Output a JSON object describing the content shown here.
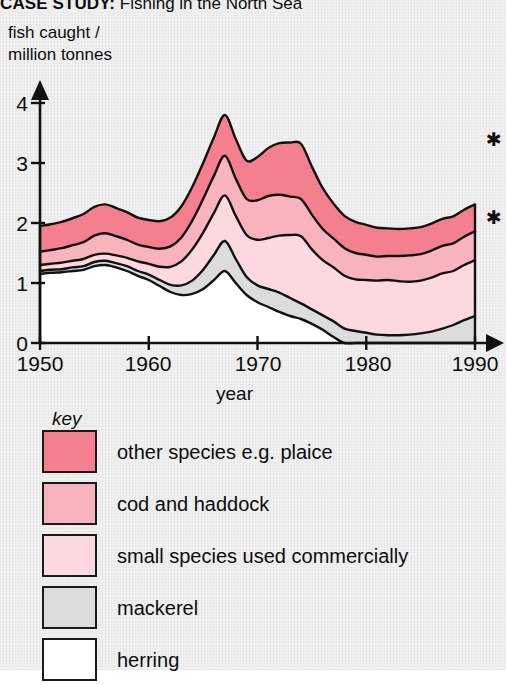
{
  "title": {
    "lead": "CASE STUDY:",
    "rest": " Fishing in the North Sea"
  },
  "y_caption": "fish caught /\nmillion tonnes",
  "annotations": {
    "star_upper": "✱",
    "star_lower": "✱"
  },
  "legend": {
    "heading": "key",
    "items": [
      {
        "label": "other species e.g. plaice",
        "color": "#f4808f"
      },
      {
        "label": "cod and haddock",
        "color": "#f8b3bd"
      },
      {
        "label": "small species used commercially",
        "color": "#fbd9de"
      },
      {
        "label": "mackerel",
        "color": "#dcdcdc"
      },
      {
        "label": "herring",
        "color": "#ffffff"
      }
    ]
  },
  "chart_data": {
    "type": "area",
    "title": "CASE STUDY: Fishing in the North Sea",
    "xlabel": "year",
    "ylabel": "fish caught / million tonnes",
    "xlim": [
      1950,
      1990
    ],
    "ylim": [
      0,
      4
    ],
    "xticks": [
      1950,
      1960,
      1970,
      1980,
      1990
    ],
    "yticks": [
      0,
      1,
      2,
      3,
      4
    ],
    "grid": false,
    "legend_position": "below-plot",
    "stacked": true,
    "stack_order_bottom_to_top": [
      "herring",
      "mackerel",
      "small species used commercially",
      "cod and haddock",
      "other species e.g. plaice"
    ],
    "x": [
      1950,
      1951,
      1952,
      1953,
      1954,
      1955,
      1956,
      1957,
      1958,
      1959,
      1960,
      1961,
      1962,
      1963,
      1964,
      1965,
      1966,
      1967,
      1968,
      1969,
      1970,
      1971,
      1972,
      1973,
      1974,
      1975,
      1976,
      1977,
      1978,
      1979,
      1980,
      1981,
      1982,
      1983,
      1984,
      1985,
      1986,
      1987,
      1988,
      1989,
      1990
    ],
    "series": [
      {
        "name": "herring",
        "color": "#ffffff",
        "values": [
          1.15,
          1.17,
          1.18,
          1.2,
          1.22,
          1.28,
          1.3,
          1.26,
          1.2,
          1.12,
          1.05,
          0.95,
          0.85,
          0.8,
          0.82,
          0.9,
          1.05,
          1.2,
          1.0,
          0.8,
          0.68,
          0.6,
          0.52,
          0.45,
          0.4,
          0.32,
          0.22,
          0.1,
          0.0,
          0.0,
          0.0,
          0.0,
          0.0,
          0.0,
          0.0,
          0.0,
          0.0,
          0.0,
          0.0,
          0.0,
          0.0
        ]
      },
      {
        "name": "mackerel",
        "color": "#dcdcdc",
        "values": [
          0.05,
          0.05,
          0.05,
          0.06,
          0.06,
          0.07,
          0.07,
          0.07,
          0.08,
          0.08,
          0.09,
          0.1,
          0.12,
          0.16,
          0.22,
          0.32,
          0.42,
          0.5,
          0.4,
          0.3,
          0.28,
          0.3,
          0.32,
          0.3,
          0.26,
          0.24,
          0.24,
          0.26,
          0.24,
          0.2,
          0.17,
          0.14,
          0.13,
          0.13,
          0.14,
          0.16,
          0.19,
          0.24,
          0.3,
          0.38,
          0.45
        ]
      },
      {
        "name": "small species used commercially",
        "color": "#fbd9de",
        "values": [
          0.1,
          0.1,
          0.11,
          0.11,
          0.12,
          0.12,
          0.12,
          0.13,
          0.14,
          0.16,
          0.18,
          0.22,
          0.3,
          0.4,
          0.52,
          0.62,
          0.7,
          0.76,
          0.72,
          0.7,
          0.76,
          0.85,
          0.95,
          1.05,
          1.12,
          1.0,
          0.92,
          0.9,
          0.88,
          0.86,
          0.88,
          0.9,
          0.92,
          0.9,
          0.88,
          0.88,
          0.9,
          0.92,
          0.9,
          0.92,
          0.93
        ]
      },
      {
        "name": "cod and haddock",
        "color": "#f8b3bd",
        "values": [
          0.22,
          0.23,
          0.24,
          0.26,
          0.28,
          0.32,
          0.34,
          0.32,
          0.3,
          0.28,
          0.28,
          0.3,
          0.34,
          0.4,
          0.48,
          0.56,
          0.62,
          0.66,
          0.62,
          0.6,
          0.66,
          0.7,
          0.68,
          0.64,
          0.62,
          0.58,
          0.52,
          0.48,
          0.46,
          0.44,
          0.42,
          0.4,
          0.4,
          0.42,
          0.44,
          0.44,
          0.45,
          0.46,
          0.46,
          0.47,
          0.48
        ]
      },
      {
        "name": "other species e.g. plaice",
        "color": "#f4808f",
        "values": [
          0.43,
          0.43,
          0.44,
          0.45,
          0.47,
          0.48,
          0.48,
          0.47,
          0.46,
          0.45,
          0.45,
          0.46,
          0.48,
          0.52,
          0.56,
          0.6,
          0.64,
          0.68,
          0.66,
          0.64,
          0.72,
          0.8,
          0.86,
          0.9,
          0.92,
          0.8,
          0.68,
          0.58,
          0.54,
          0.52,
          0.5,
          0.48,
          0.46,
          0.45,
          0.45,
          0.45,
          0.45,
          0.45,
          0.45,
          0.45,
          0.45
        ]
      }
    ],
    "totals_note": "stack total peaks at about 3.6 in 1967 and about 3.75 in 1974, ending near 2.4 in 1990"
  }
}
